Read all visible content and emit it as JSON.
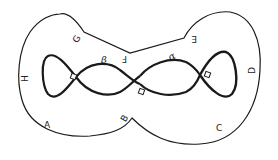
{
  "diagram": {
    "outer_labels": {
      "A": "A",
      "B": "B",
      "C": "C",
      "D": "D",
      "E": "E",
      "F": "F",
      "G": "G",
      "H": "H"
    },
    "greek_labels": {
      "alpha": "α",
      "beta": "β"
    },
    "crossing_markers": 3,
    "colors": {
      "stroke": "#1a1a1a",
      "background": "#ffffff"
    }
  }
}
